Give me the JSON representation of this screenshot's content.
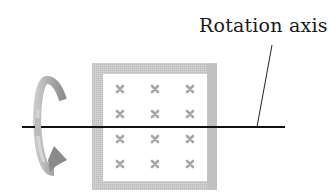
{
  "diagram": {
    "axis_label": "Rotation axis",
    "rotation_arrow": {
      "direction": "counter-clockwise-around-axis",
      "icon": "curved-rotation-arrow-icon"
    },
    "loop": {
      "shape": "square",
      "field_markers": {
        "symbol": "×",
        "rows": 4,
        "cols": 3,
        "meaning": "magnetic field into page"
      }
    },
    "colors": {
      "frame": "#c4c4c4",
      "frame_shadow": "#b0b0b0",
      "cross": "#a8a8a8",
      "axis": "#111111",
      "arrow": "#9a9a9a"
    }
  }
}
